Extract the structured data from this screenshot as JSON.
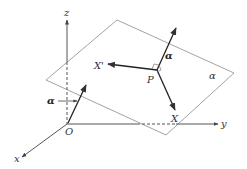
{
  "diagram": {
    "type": "3d-vector-plane",
    "axes": {
      "x_label": "x",
      "y_label": "y",
      "z_label": "z",
      "origin_label": "O"
    },
    "plane": {
      "label": "α"
    },
    "point": {
      "label": "P"
    },
    "vectors": {
      "normal_at_P_label": "α",
      "x_prime_label": "X'",
      "x_label": "X",
      "normal_at_O_label": "α"
    },
    "colors": {
      "line": "#333333",
      "plane_edge": "#999999",
      "background": "#ffffff"
    }
  }
}
